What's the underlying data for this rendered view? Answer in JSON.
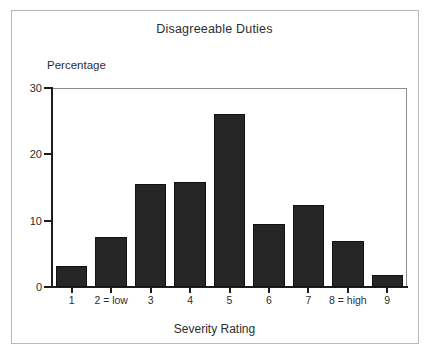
{
  "chart_data": {
    "type": "bar",
    "title": "Disagreeable Duties",
    "xlabel": "Severity Rating",
    "ylabel": "Percentage",
    "categories": [
      "1",
      "2 = low",
      "3",
      "4",
      "5",
      "6",
      "7",
      "8 = high",
      "9"
    ],
    "values": [
      3.2,
      7.5,
      15.5,
      15.8,
      26.1,
      9.5,
      12.4,
      7.0,
      1.8
    ],
    "ylim": [
      0,
      30
    ],
    "yticks": [
      0,
      10,
      20,
      30
    ],
    "ytick_labels": [
      "0",
      "10",
      "20",
      "30"
    ],
    "grid": false,
    "legend": null,
    "bar_color": "#262626",
    "axis_color": "#1d1d1d",
    "frame_color": "#b9b9b9",
    "background": "#ffffff"
  }
}
